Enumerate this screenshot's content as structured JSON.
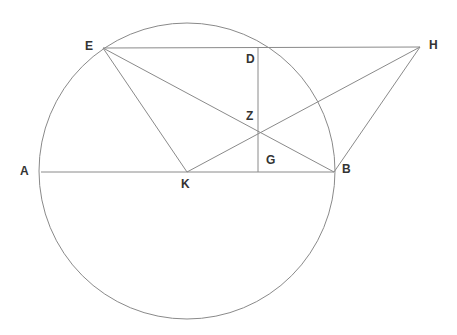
{
  "figure": {
    "width": 457,
    "height": 335,
    "background_color": "#ffffff",
    "stroke_color": "#8a8a8a",
    "label_color": "#333333",
    "stroke_width": 1
  },
  "labels": {
    "A": "A",
    "B": "B",
    "D": "D",
    "E": "E",
    "G": "G",
    "H": "H",
    "K": "K",
    "Z": "Z"
  },
  "chart_data": {
    "type": "diagram",
    "xlabel": "",
    "ylabel": "",
    "xlim": [
      0,
      457
    ],
    "ylim": [
      0,
      335
    ],
    "grid": false,
    "legend": null,
    "circle": {
      "center_x": 187,
      "center_y": 171,
      "radius": 148,
      "stroke": "#8a8a8a"
    },
    "points": [
      {
        "name": "A",
        "x": 41,
        "y": 172,
        "label_x": 20,
        "label_y": 165,
        "on_circle": true
      },
      {
        "name": "E",
        "x": 103,
        "y": 48,
        "label_x": 85,
        "label_y": 40,
        "on_circle": true
      },
      {
        "name": "D",
        "x": 258,
        "y": 47,
        "label_x": 246,
        "label_y": 53,
        "on_circle": false
      },
      {
        "name": "H",
        "x": 420,
        "y": 47,
        "label_x": 429,
        "label_y": 39,
        "on_circle": false
      },
      {
        "name": "Z",
        "x": 257,
        "y": 132,
        "label_x": 246,
        "label_y": 110,
        "on_circle": false
      },
      {
        "name": "G",
        "x": 258,
        "y": 172,
        "label_x": 266,
        "label_y": 154,
        "on_circle": false
      },
      {
        "name": "K",
        "x": 187,
        "y": 172,
        "label_x": 181,
        "label_y": 178,
        "on_circle": false
      },
      {
        "name": "B",
        "x": 334,
        "y": 172,
        "label_x": 342,
        "label_y": 163,
        "on_circle": true
      }
    ],
    "segments": [
      {
        "name": "A-B",
        "from": "A",
        "x1": 41,
        "y1": 172,
        "to": "B",
        "x2": 334,
        "y2": 172
      },
      {
        "name": "E-H",
        "from": "E",
        "x1": 103,
        "y1": 48,
        "to": "H",
        "x2": 420,
        "y2": 47
      },
      {
        "name": "E-K",
        "from": "E",
        "x1": 103,
        "y1": 48,
        "to": "K",
        "x2": 187,
        "y2": 172
      },
      {
        "name": "E-B",
        "from": "E",
        "x1": 103,
        "y1": 48,
        "to": "B",
        "x2": 334,
        "y2": 172
      },
      {
        "name": "K-H",
        "from": "K",
        "x1": 187,
        "y1": 172,
        "to": "H",
        "x2": 420,
        "y2": 47
      },
      {
        "name": "B-H",
        "from": "B",
        "x1": 334,
        "y1": 172,
        "to": "H",
        "x2": 420,
        "y2": 47
      },
      {
        "name": "D-G",
        "from": "D",
        "x1": 258,
        "y1": 47,
        "to": "G",
        "x2": 258,
        "y2": 172
      }
    ]
  }
}
